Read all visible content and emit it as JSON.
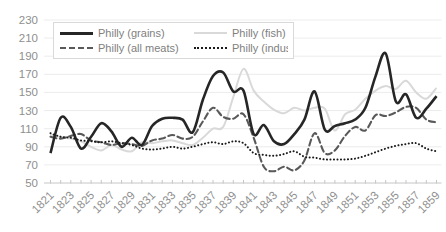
{
  "colors": {
    "background": "#ffffff",
    "gridline": "#ececec",
    "axis_line": "#c6c6c6",
    "tick_label": "#8f8f8f",
    "legend_border": "#d9d9d9",
    "legend_text": "#808080"
  },
  "chart_data": {
    "type": "line",
    "title": "",
    "xlabel": "",
    "ylabel": "",
    "ylim": [
      50,
      230
    ],
    "y_ticks": [
      50,
      70,
      90,
      110,
      130,
      150,
      170,
      190,
      210,
      230
    ],
    "grid": "horizontal",
    "legend_position": "top-left-inside",
    "x": [
      1821,
      1822,
      1823,
      1824,
      1825,
      1826,
      1827,
      1828,
      1829,
      1830,
      1831,
      1832,
      1833,
      1834,
      1835,
      1836,
      1837,
      1838,
      1839,
      1840,
      1841,
      1842,
      1843,
      1844,
      1845,
      1846,
      1847,
      1848,
      1849,
      1850,
      1851,
      1852,
      1853,
      1854,
      1855,
      1856,
      1857,
      1858,
      1859
    ],
    "x_tick_labels": [
      "1821",
      "1823",
      "1825",
      "1827",
      "1829",
      "1831",
      "1833",
      "1835",
      "1837",
      "1839",
      "1841",
      "1843",
      "1845",
      "1847",
      "1849",
      "1851",
      "1853",
      "1855",
      "1857",
      "1859"
    ],
    "draw_order": [
      1,
      2,
      0,
      3
    ],
    "series": [
      {
        "id": "grains",
        "name": "Philly (grains)",
        "color": "#262626",
        "line_style": "solid",
        "width": 2.6,
        "dash": "",
        "values": [
          83,
          122,
          112,
          88,
          101,
          116,
          107,
          90,
          100,
          92,
          113,
          121,
          122,
          120,
          106,
          142,
          168,
          172,
          151,
          152,
          104,
          114,
          96,
          93,
          104,
          120,
          151,
          109,
          113,
          116,
          120,
          133,
          168,
          193,
          140,
          148,
          122,
          132,
          146
        ]
      },
      {
        "id": "fish",
        "name": "Philly (fish)",
        "color": "#d9d9d9",
        "line_style": "solid",
        "width": 2,
        "dash": "",
        "values": [
          103,
          101,
          99,
          96,
          90,
          86,
          92,
          87,
          85,
          95,
          94,
          96,
          97,
          94,
          92,
          100,
          110,
          112,
          145,
          176,
          152,
          140,
          131,
          127,
          133,
          130,
          133,
          132,
          108,
          126,
          131,
          143,
          152,
          157,
          154,
          163,
          150,
          143,
          155
        ]
      },
      {
        "id": "meats",
        "name": "Philly (all meats)",
        "color": "#595959",
        "line_style": "dashed",
        "width": 2.1,
        "dash": "6 3.5",
        "values": [
          101,
          99,
          102,
          104,
          97,
          95,
          92,
          94,
          93,
          91,
          97,
          99,
          103,
          99,
          101,
          118,
          133,
          123,
          121,
          126,
          100,
          68,
          63,
          68,
          64,
          75,
          105,
          83,
          86,
          102,
          112,
          108,
          125,
          124,
          128,
          134,
          133,
          120,
          117
        ]
      },
      {
        "id": "industrial",
        "name": "Philly (industrial)",
        "color": "#1a1a1a",
        "line_style": "dotted",
        "width": 2,
        "dash": "0.1 3.4",
        "values": [
          105,
          101,
          100,
          97,
          96,
          95,
          96,
          94,
          92,
          88,
          87,
          88,
          90,
          88,
          90,
          93,
          95,
          93,
          96,
          94,
          83,
          81,
          80,
          82,
          85,
          79,
          78,
          76,
          76,
          76,
          77,
          80,
          84,
          88,
          91,
          93,
          94,
          88,
          85
        ]
      }
    ]
  }
}
